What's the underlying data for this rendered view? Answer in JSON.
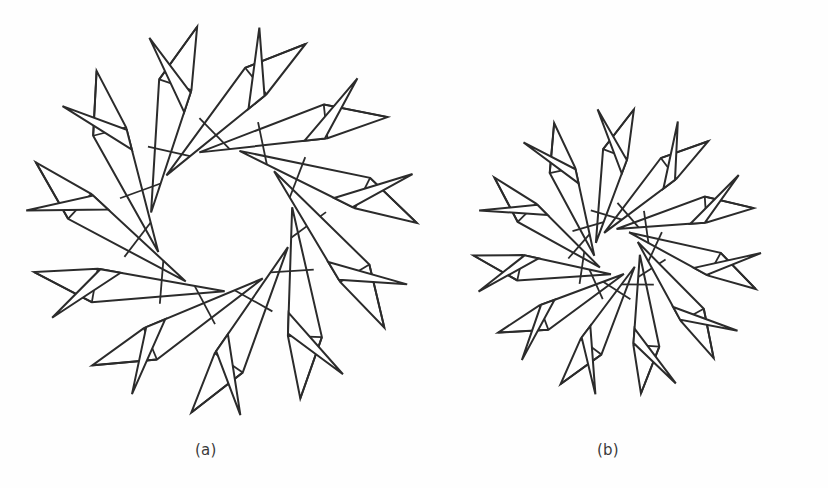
{
  "plate": {
    "width": 828,
    "height": 488,
    "background_color": "#fefefe",
    "ink_color": "#2b2b2b",
    "face_color": "#ffffff",
    "title": "Two interwoven-strip rotational star figures"
  },
  "captions": {
    "a": "(a)",
    "b": "(b)"
  },
  "chart_data": {
    "type": "diagram",
    "subtitle": "",
    "xlabel": "",
    "ylabel": "",
    "legend": [],
    "annotations": [
      "(a)",
      "(b)"
    ],
    "figures": [
      {
        "label": "(a)",
        "caption": "(a)",
        "description": "Eleven congruent straight paper strips woven cyclically about a common centre; each strip terminates in a folded triangular flap, leaving a large open polygonal hole in the middle.",
        "symmetry_order": 11,
        "center": [
          222,
          220
        ],
        "outer_radius": 196,
        "inner_radius": 88,
        "strip_width": 34,
        "flap_length": 62,
        "rotation_offset_deg": -8,
        "strip_count": 11,
        "line_width": 2.0
      },
      {
        "label": "(b)",
        "caption": "(b)",
        "description": "Eleven narrow tapered strips woven about a common centre with a much tighter twist; the points are sharper and the central hole is small.",
        "symmetry_order": 11,
        "center": [
          617,
          252
        ],
        "outer_radius": 144,
        "inner_radius": 36,
        "strip_width": 26,
        "flap_length": 48,
        "rotation_offset_deg": 6,
        "strip_count": 11,
        "line_width": 2.0
      }
    ]
  }
}
